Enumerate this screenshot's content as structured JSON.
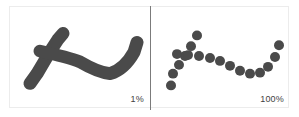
{
  "figure": {
    "type": "comparison-figure",
    "background_color": "#ffffff",
    "frame_color": "#ececec",
    "divider_color": "#7b7b7b",
    "stroke_color": "#4a4a4a",
    "panels": [
      {
        "id": "left",
        "name": "solid-stroke-panel",
        "label": "1%",
        "render_mode": "solid",
        "description": "continuous thick dark stroke forming a hooked curve"
      },
      {
        "id": "right",
        "name": "sampled-dots-panel",
        "label": "100%",
        "render_mode": "dots",
        "description": "same curve rendered as a series of discrete round dots"
      }
    ]
  },
  "chart_data": {
    "type": "scatter",
    "title": "",
    "xlabel": "",
    "ylabel": "",
    "grid": false,
    "legend": null,
    "xlim": [
      0,
      140
    ],
    "ylim": [
      0,
      102
    ],
    "annotations": [
      "1%",
      "100%"
    ],
    "series": [
      {
        "name": "branch-stroke",
        "render": "solid",
        "stroke_width": 13,
        "color": "#4a4a4a",
        "points": [
          [
            20,
            78
          ],
          [
            27,
            68
          ],
          [
            34,
            56
          ],
          [
            41,
            44
          ],
          [
            48,
            33
          ],
          [
            53,
            27
          ]
        ]
      },
      {
        "name": "main-stroke",
        "render": "solid",
        "stroke_width": 13,
        "color": "#4a4a4a",
        "points": [
          [
            30,
            45
          ],
          [
            44,
            48
          ],
          [
            58,
            51
          ],
          [
            70,
            56
          ],
          [
            80,
            62
          ],
          [
            90,
            67
          ],
          [
            100,
            68
          ],
          [
            110,
            65
          ],
          [
            118,
            57
          ],
          [
            124,
            46
          ],
          [
            127,
            36
          ]
        ]
      },
      {
        "name": "sampled-branch-dots",
        "render": "dots",
        "dot_radius": 5,
        "color": "#4a4a4a",
        "points": [
          [
            20,
            80
          ],
          [
            22,
            68
          ],
          [
            28,
            59
          ],
          [
            34,
            50
          ],
          [
            40,
            40
          ],
          [
            46,
            29
          ]
        ]
      },
      {
        "name": "sampled-main-dots",
        "render": "dots",
        "dot_radius": 5,
        "color": "#4a4a4a",
        "points": [
          [
            26,
            48
          ],
          [
            37,
            49
          ],
          [
            48,
            50
          ],
          [
            59,
            52
          ],
          [
            69,
            55
          ],
          [
            79,
            60
          ],
          [
            89,
            65
          ],
          [
            99,
            68
          ],
          [
            109,
            67
          ],
          [
            117,
            61
          ],
          [
            124,
            51
          ],
          [
            128,
            39
          ]
        ]
      }
    ]
  }
}
